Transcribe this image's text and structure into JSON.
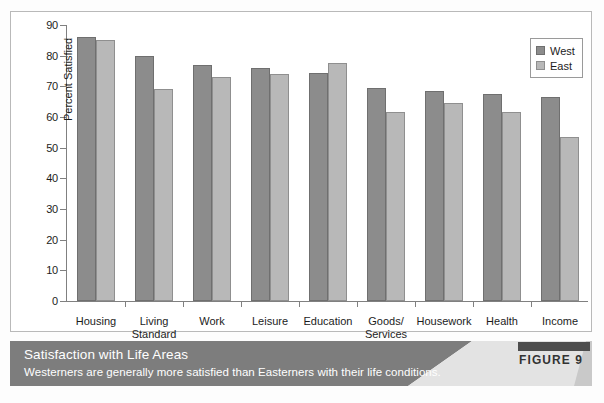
{
  "chart_data": {
    "type": "bar",
    "title": "Satisfaction with Life Areas",
    "subtitle": "Westerners are generally more satisfied than Easterners with their life conditions.",
    "xlabel": "",
    "ylabel": "Percent Satisfied",
    "ylim": [
      0,
      90
    ],
    "ytick_step": 10,
    "yticks": [
      0,
      10,
      20,
      30,
      40,
      50,
      60,
      70,
      80,
      90
    ],
    "grid": false,
    "legend_position": "top-right",
    "categories": [
      "Housing",
      "Living\nStandard",
      "Work",
      "Leisure",
      "Education",
      "Goods/\nServices",
      "Housework",
      "Health",
      "Income"
    ],
    "series": [
      {
        "name": "West",
        "color": "#8c8c8c",
        "values": [
          86,
          80,
          77,
          76,
          74.5,
          69.5,
          68.5,
          67.5,
          66.5
        ]
      },
      {
        "name": "East",
        "color": "#b8b8b8",
        "values": [
          85,
          69,
          73,
          74,
          77.5,
          61.5,
          64.5,
          61.5,
          53.5
        ]
      }
    ]
  },
  "legend": {
    "items": [
      {
        "label": "West",
        "swatch": "west"
      },
      {
        "label": "East",
        "swatch": "east"
      }
    ]
  },
  "caption": {
    "title": "Satisfaction with Life Areas",
    "subtitle": "Westerners are generally more satisfied than Easterners with their life conditions.",
    "figure_label": "FIGURE 9"
  },
  "colors": {
    "west_bar": "#8c8c8c",
    "east_bar": "#b8b8b8",
    "banner": "#7d7d7d",
    "banner_light": "#e3e3e3",
    "badge_bar": "#4d4d4d",
    "frame": "#b9b9b9",
    "axis": "#808080"
  }
}
